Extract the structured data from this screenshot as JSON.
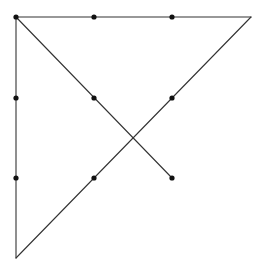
{
  "diagram": {
    "title": "",
    "width": 264,
    "height": 269,
    "line_color": "#333333",
    "dot_color": "#111111",
    "line_width": 1.1,
    "dot_radius": 2.6,
    "dots": [
      {
        "id": "d1",
        "x": 16,
        "y": 17
      },
      {
        "id": "d2",
        "x": 94,
        "y": 17
      },
      {
        "id": "d3",
        "x": 172,
        "y": 17
      },
      {
        "id": "d4",
        "x": 16,
        "y": 98
      },
      {
        "id": "d5",
        "x": 94,
        "y": 98
      },
      {
        "id": "d6",
        "x": 172,
        "y": 98
      },
      {
        "id": "d7",
        "x": 16,
        "y": 178
      },
      {
        "id": "d8",
        "x": 94,
        "y": 178
      },
      {
        "id": "d9",
        "x": 172,
        "y": 178
      }
    ],
    "lines": [
      {
        "id": "top-edge",
        "x1": 16,
        "y1": 17,
        "x2": 251,
        "y2": 17
      },
      {
        "id": "left-edge",
        "x1": 16,
        "y1": 17,
        "x2": 16,
        "y2": 258
      },
      {
        "id": "down-diagonal",
        "x1": 16,
        "y1": 17,
        "x2": 172,
        "y2": 178
      },
      {
        "id": "up-diagonal",
        "x1": 16,
        "y1": 258,
        "x2": 251,
        "y2": 17
      }
    ]
  }
}
